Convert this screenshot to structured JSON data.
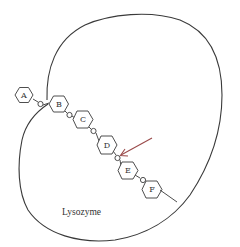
{
  "diagram": {
    "enzyme_label": "Lysozyme",
    "colors": {
      "outline": "#3a3a3a",
      "arrow": "#9a4a4a",
      "background": "#ffffff"
    },
    "sugar_units": [
      {
        "label": "A"
      },
      {
        "label": "B"
      },
      {
        "label": "C"
      },
      {
        "label": "D"
      },
      {
        "label": "E"
      },
      {
        "label": "F"
      }
    ],
    "glycosidic_links": [
      "A-B",
      "B-C",
      "C-D",
      "D-E",
      "E-F"
    ],
    "arrow": {
      "points_to": "D-E glycosidic bond",
      "meaning": "cleavage site"
    }
  }
}
